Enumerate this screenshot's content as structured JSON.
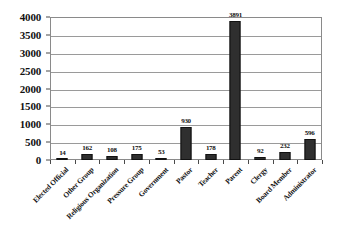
{
  "chart_data": {
    "type": "bar",
    "title": "",
    "xlabel": "",
    "ylabel": "",
    "ylim": [
      0,
      4000
    ],
    "grid": true,
    "legend": "none",
    "orientation": "vertical",
    "categories": [
      "Elected Official",
      "Other Group",
      "Religious Organization",
      "Pressure Group",
      "Government",
      "Pastor",
      "Teacher",
      "Parent",
      "Clergy",
      "Board Member",
      "Administrator"
    ],
    "values": [
      14,
      162,
      108,
      175,
      53,
      930,
      178,
      3891,
      92,
      232,
      596
    ],
    "value_labels": [
      "14",
      "162",
      "108",
      "175",
      "53",
      "930",
      "178",
      "3891",
      "92",
      "232",
      "596"
    ],
    "y_ticks": [
      0,
      500,
      1000,
      1500,
      2000,
      2500,
      3000,
      3500,
      4000
    ],
    "y_tick_labels": [
      "0",
      "500",
      "1000",
      "1500",
      "2000",
      "2500",
      "3000",
      "3500",
      "4000"
    ],
    "bar_color": "#2f2f2f",
    "grid_color": "#9a9a9a",
    "axis_color": "#8a8a8a",
    "background_color": "#ffffff"
  }
}
